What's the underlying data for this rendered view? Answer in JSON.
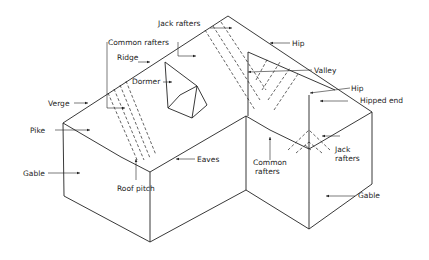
{
  "diagram": {
    "labels": {
      "jack_rafters_top": "Jack rafters",
      "common_rafters_top": "Common rafters",
      "ridge": "Ridge",
      "dormer": "Dormer",
      "verge": "Verge",
      "pike": "Pike",
      "gable_left": "Gable",
      "roof_pitch": "Roof pitch",
      "eaves": "Eaves",
      "hip_top": "Hip",
      "valley": "Valley",
      "hip_right": "Hip",
      "hipped_end": "Hipped end",
      "common_rafters_bottom_1": "Common",
      "common_rafters_bottom_2": "rafters",
      "jack_rafters_bottom_1": "Jack",
      "jack_rafters_bottom_2": "rafters",
      "gable_right": "Gable"
    },
    "colors": {
      "line": "#222222",
      "background": "#ffffff"
    }
  }
}
